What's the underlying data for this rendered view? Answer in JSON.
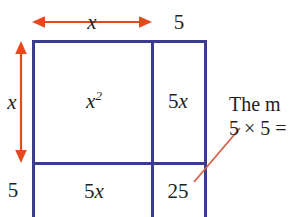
{
  "figure": {
    "type": "area-model-diagram",
    "colors": {
      "box_border": "#3b3b8f",
      "arrow": "#e8491c",
      "leader_line": "#d4634a",
      "text": "#231f20",
      "background": "#ffffff"
    },
    "top_dimensions": [
      {
        "name": "width-x",
        "label": "x",
        "style": "italic",
        "has_arrow": true
      },
      {
        "name": "width-5",
        "label": "5",
        "style": "upright",
        "has_arrow": false
      }
    ],
    "left_dimensions": [
      {
        "name": "height-x",
        "label": "x",
        "style": "italic",
        "has_arrow": true
      },
      {
        "name": "height-5",
        "label": "5",
        "style": "upright",
        "has_arrow": false
      }
    ],
    "cells": [
      {
        "name": "cell-x-squared",
        "row": 0,
        "col": 0,
        "num": "",
        "var": "x",
        "sup": "2"
      },
      {
        "name": "cell-5x-top-right",
        "row": 0,
        "col": 1,
        "num": "5",
        "var": "x",
        "sup": ""
      },
      {
        "name": "cell-5x-bottom-left",
        "row": 1,
        "col": 0,
        "num": "5",
        "var": "x",
        "sup": ""
      },
      {
        "name": "cell-25",
        "row": 1,
        "col": 1,
        "num": "25",
        "var": "",
        "sup": ""
      }
    ],
    "callout": {
      "line1": "The m",
      "line2": "5 × 5 ="
    }
  }
}
